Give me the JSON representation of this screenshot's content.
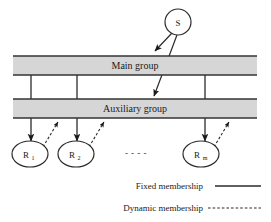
{
  "diagram": {
    "source_node": {
      "label": "S",
      "cx": 178,
      "cy": 22,
      "r": 13
    },
    "bands": [
      {
        "id": "main-group",
        "label": "Main group",
        "x": 13,
        "y": 56,
        "width": 244,
        "height": 19,
        "fill": "#d6d6d6",
        "stroke": "#333333"
      },
      {
        "id": "auxiliary-group",
        "label": "Auxiliary group",
        "x": 13,
        "y": 99,
        "width": 244,
        "height": 19,
        "fill": "#d6d6d6",
        "stroke": "#333333"
      }
    ],
    "resource_nodes": [
      {
        "id": "r1",
        "label": "R",
        "subscript": "1",
        "cx": 30,
        "cy": 154,
        "rx": 18,
        "ry": 13
      },
      {
        "id": "r2",
        "label": "R",
        "subscript": "2",
        "cx": 76,
        "cy": 154,
        "rx": 18,
        "ry": 13
      },
      {
        "id": "rm",
        "label": "R",
        "subscript": "m",
        "cx": 201,
        "cy": 154,
        "rx": 18,
        "ry": 13
      }
    ],
    "ellipsis": {
      "text": "- - - -",
      "x": 136,
      "y": 153
    },
    "fixed_links": [
      {
        "from": "main-group",
        "to": "r1",
        "x": 31
      },
      {
        "from": "main-group",
        "to": "r2",
        "x": 77
      },
      {
        "from": "main-group",
        "to": "rm",
        "x": 205
      }
    ],
    "dynamic_links": [
      {
        "from": "r1",
        "to": "auxiliary-group",
        "x1": 43,
        "y1": 146,
        "x2": 57,
        "y2": 123
      },
      {
        "from": "r2",
        "to": "auxiliary-group",
        "x1": 89,
        "y1": 146,
        "x2": 103,
        "y2": 123
      },
      {
        "from": "rm",
        "to": "auxiliary-group",
        "x1": 214,
        "y1": 146,
        "x2": 228,
        "y2": 123
      }
    ],
    "source_links": [
      {
        "from": "S",
        "to": "main-group",
        "x1": 172,
        "y1": 34,
        "x2": 155,
        "y2": 52
      },
      {
        "from": "S",
        "to": "auxiliary-group",
        "x1": 176,
        "y1": 35,
        "x2": 154,
        "y2": 96
      }
    ],
    "legend": {
      "items": [
        {
          "id": "fixed-membership",
          "label": "Fixed membership",
          "style": "solid",
          "line_x1": 215,
          "line_x2": 261,
          "line_y": 186
        },
        {
          "id": "dynamic-membership",
          "label": "Dynamic membership",
          "style": "dashed",
          "line_x1": 208,
          "line_x2": 261,
          "line_y": 208
        }
      ]
    },
    "colors": {
      "band_fill": "#d6d6d6",
      "stroke": "#333333",
      "text": "#1a1a1a",
      "background": "#ffffff"
    }
  }
}
